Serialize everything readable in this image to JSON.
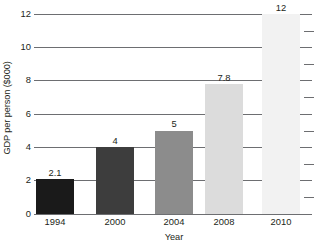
{
  "chart_data": {
    "type": "bar",
    "title": "",
    "subtitle": "",
    "xlabel": "Year",
    "ylabel": "GDP per person ($000)",
    "categories": [
      "1994",
      "2000",
      "2004",
      "2008",
      "2010"
    ],
    "values": [
      2.1,
      4,
      5,
      7.8,
      12
    ],
    "value_labels": [
      "2.1",
      "4",
      "5",
      "7.8",
      "12"
    ],
    "bar_colors": [
      "#1a1a1a",
      "#3d3d3d",
      "#8c8c8c",
      "#dcdcdc",
      "#f2f2f2"
    ],
    "ylim": [
      0,
      12
    ],
    "ytick_values": [
      0,
      2,
      4,
      6,
      8,
      10,
      12
    ],
    "ytick_labels": [
      "0",
      "2",
      "4",
      "6",
      "8",
      "10",
      "12"
    ],
    "grid": true,
    "grid_axis": "y",
    "grid_color": "#6d6e71",
    "legend": false,
    "legend_position": "none",
    "annotations": []
  },
  "axes": {
    "y_title": "GDP per person ($000)",
    "x_title": "Year"
  },
  "ticks": {
    "y": [
      "12",
      "10",
      "8",
      "6",
      "4",
      "2",
      "0"
    ]
  },
  "bars": [
    {
      "category": "1994",
      "label": "2.1",
      "value": 2.1,
      "color": "#1a1a1a"
    },
    {
      "category": "2000",
      "label": "4",
      "value": 4,
      "color": "#3d3d3d"
    },
    {
      "category": "2004",
      "label": "5",
      "value": 5,
      "color": "#8c8c8c"
    },
    {
      "category": "2008",
      "label": "7.8",
      "value": 7.8,
      "color": "#dcdcdc"
    },
    {
      "category": "2010",
      "label": "12",
      "value": 12,
      "color": "#f2f2f2"
    }
  ]
}
